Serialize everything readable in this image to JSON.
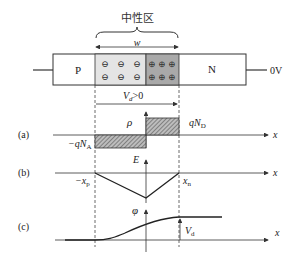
{
  "title": "中性区",
  "width_label": "w",
  "p_label": "P",
  "n_label": "N",
  "voltage_label": "0V",
  "bias_label": "V",
  "bias_sub": "d",
  "bias_cond": ">0",
  "colors": {
    "p_depletion": "#e4e4e4",
    "n_depletion": "#a9a9a9",
    "line": "#333333"
  },
  "panels": {
    "a": {
      "tag": "(a)",
      "axis_label": "ρ",
      "neg_label": "−qN",
      "neg_sub": "A",
      "pos_label": "qN",
      "pos_sub": "D",
      "x_label": "x"
    },
    "b": {
      "tag": "(b)",
      "axis_label": "E",
      "left_label": "−x",
      "left_sub": "p",
      "right_label": "x",
      "right_sub": "n",
      "x_label": "x"
    },
    "c": {
      "tag": "(c)",
      "axis_label": "φ",
      "vd_label": "V",
      "vd_sub": "d",
      "x_label": "x"
    }
  },
  "ions": {
    "negative_symbol": "⊖",
    "positive_symbol": "⊕"
  }
}
